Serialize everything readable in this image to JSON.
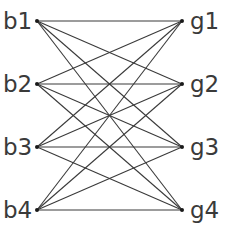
{
  "diagram": {
    "type": "complete-bipartite-graph",
    "left_nodes": [
      {
        "id": "b1",
        "label": "b1",
        "x": 37,
        "y": 21
      },
      {
        "id": "b2",
        "label": "b2",
        "x": 37,
        "y": 84
      },
      {
        "id": "b3",
        "label": "b3",
        "x": 37,
        "y": 147
      },
      {
        "id": "b4",
        "label": "b4",
        "x": 37,
        "y": 210
      }
    ],
    "right_nodes": [
      {
        "id": "g1",
        "label": "g1",
        "x": 182,
        "y": 21
      },
      {
        "id": "g2",
        "label": "g2",
        "x": 182,
        "y": 84
      },
      {
        "id": "g3",
        "label": "g3",
        "x": 182,
        "y": 147
      },
      {
        "id": "g4",
        "label": "g4",
        "x": 182,
        "y": 210
      }
    ],
    "edges": [
      [
        "b1",
        "g1"
      ],
      [
        "b1",
        "g2"
      ],
      [
        "b1",
        "g3"
      ],
      [
        "b1",
        "g4"
      ],
      [
        "b2",
        "g1"
      ],
      [
        "b2",
        "g2"
      ],
      [
        "b2",
        "g3"
      ],
      [
        "b2",
        "g4"
      ],
      [
        "b3",
        "g1"
      ],
      [
        "b3",
        "g2"
      ],
      [
        "b3",
        "g3"
      ],
      [
        "b3",
        "g4"
      ],
      [
        "b4",
        "g1"
      ],
      [
        "b4",
        "g2"
      ],
      [
        "b4",
        "g3"
      ],
      [
        "b4",
        "g4"
      ]
    ],
    "colors": {
      "edge": "#3a3a3a",
      "label": "#3a3a3a",
      "node": "#1a1a1a"
    }
  }
}
